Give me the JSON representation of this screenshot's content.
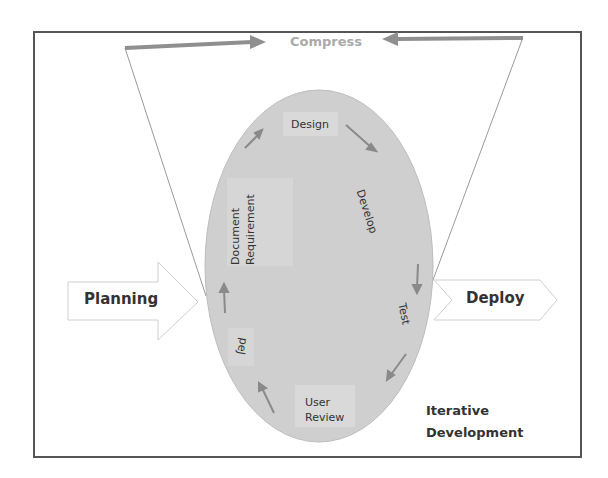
{
  "diagram": {
    "title_top": "Compress",
    "left_phase": "Planning",
    "right_phase": "Deploy",
    "cycle_label_line1": "Iterative",
    "cycle_label_line2": "Development",
    "cycle_steps": [
      {
        "label": "Design"
      },
      {
        "label": "Develop"
      },
      {
        "label": "Test"
      },
      {
        "label": "User Review",
        "line1": "User",
        "line2": "Review"
      },
      {
        "label": "peJ"
      },
      {
        "label": "Document Requirement",
        "line1": "Document",
        "line2": "Requirement"
      }
    ],
    "colors": {
      "ellipse_fill": "#cfcfcf",
      "arrow_gray": "#8f8f8f",
      "frame": "#555555",
      "compress_text": "#aaaaaa"
    }
  }
}
